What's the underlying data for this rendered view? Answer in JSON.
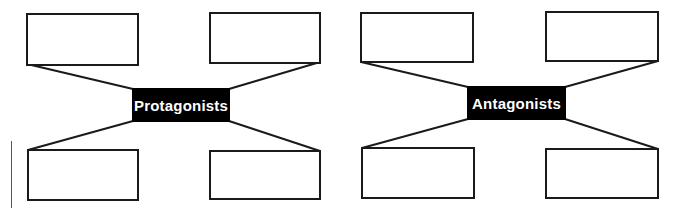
{
  "diagrams": [
    {
      "label": "Protagonists",
      "center": {
        "x": 132,
        "y": 88,
        "w": 98,
        "h": 34
      },
      "boxes": [
        {
          "position": "top-left",
          "x": 26,
          "y": 13,
          "w": 112,
          "h": 52,
          "text": ""
        },
        {
          "position": "top-right",
          "x": 209,
          "y": 12,
          "w": 112,
          "h": 51,
          "text": ""
        },
        {
          "position": "bottom-left",
          "x": 27,
          "y": 149,
          "w": 112,
          "h": 52,
          "text": ""
        },
        {
          "position": "bottom-right",
          "x": 209,
          "y": 150,
          "w": 112,
          "h": 50,
          "text": ""
        }
      ]
    },
    {
      "label": "Antagonists",
      "center": {
        "x": 467,
        "y": 86,
        "w": 99,
        "h": 34
      },
      "boxes": [
        {
          "position": "top-left",
          "x": 360,
          "y": 12,
          "w": 114,
          "h": 51,
          "text": ""
        },
        {
          "position": "top-right",
          "x": 545,
          "y": 11,
          "w": 114,
          "h": 51,
          "text": ""
        },
        {
          "position": "bottom-left",
          "x": 361,
          "y": 147,
          "w": 114,
          "h": 52,
          "text": ""
        },
        {
          "position": "bottom-right",
          "x": 545,
          "y": 148,
          "w": 114,
          "h": 51,
          "text": ""
        }
      ]
    }
  ],
  "colors": {
    "line": "#1a1a1a",
    "center_bg": "#000000",
    "center_text": "#ffffff"
  }
}
